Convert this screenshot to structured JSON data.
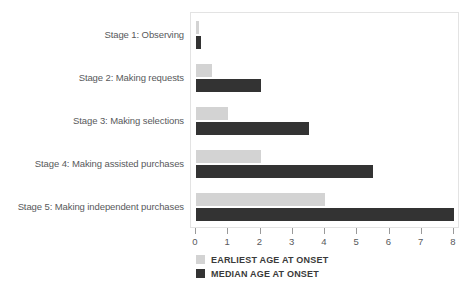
{
  "chart_data": {
    "type": "bar",
    "orientation": "horizontal",
    "title": "",
    "subtitle": "",
    "xlabel": "",
    "ylabel": "",
    "xlim": [
      0,
      8
    ],
    "grid": false,
    "legend_position": "bottom-left",
    "categories": [
      "Stage 1: Observing",
      "Stage 2: Making requests",
      "Stage 3: Making selections",
      "Stage 4: Making assisted purchases",
      "Stage 5: Making independent purchases"
    ],
    "x_ticks": [
      "0",
      "1",
      "2",
      "3",
      "4",
      "5",
      "6",
      "7",
      "8"
    ],
    "x_tick_values": [
      0,
      1,
      2,
      3,
      4,
      5,
      6,
      7,
      8
    ],
    "series": [
      {
        "name": "EARLIEST AGE AT ONSET",
        "color": "#d3d3d3",
        "values": [
          0.1,
          0.5,
          1.0,
          2.0,
          4.0
        ]
      },
      {
        "name": "MEDIAN AGE AT ONSET",
        "color": "#333333",
        "values": [
          0.15,
          2.0,
          3.5,
          5.5,
          8.0
        ]
      }
    ]
  },
  "legend": {
    "items": [
      {
        "label": "EARLIEST AGE AT ONSET",
        "color": "#d3d3d3"
      },
      {
        "label": "MEDIAN AGE AT ONSET",
        "color": "#333333"
      }
    ]
  },
  "colors": {
    "earliest": "#d3d3d3",
    "median": "#333333",
    "axis_text": "#58595b",
    "plot_border": "#e3e3e3",
    "background": "#ffffff"
  }
}
